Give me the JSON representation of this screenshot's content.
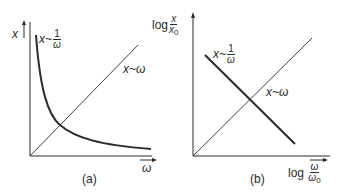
{
  "figure": {
    "panel_a": {
      "caption": "(a)",
      "y_axis_label": "x",
      "x_axis_label": "ω",
      "curves": [
        {
          "name": "inverse",
          "label_left": "x~",
          "label_num": "1",
          "label_den": "ω",
          "shape": "hyperbola",
          "style": "thick"
        },
        {
          "name": "linear",
          "label": "x~ω",
          "shape": "straight line through origin",
          "style": "thin"
        }
      ]
    },
    "panel_b": {
      "caption": "(b)",
      "y_axis_label_prefix": "log",
      "y_axis_num": "x",
      "y_axis_den": "x",
      "y_axis_den_sub": "0",
      "x_axis_label_prefix": "log",
      "x_axis_num": "ω",
      "x_axis_den": "ω",
      "x_axis_den_sub": "0",
      "curves": [
        {
          "name": "inverse",
          "label_left": "x~",
          "label_num": "1",
          "label_den": "ω",
          "shape": "straight line, negative slope",
          "style": "thick"
        },
        {
          "name": "linear",
          "label": "x~ω",
          "shape": "straight line, positive slope",
          "style": "thin"
        }
      ]
    },
    "colors": {
      "ink": "#2a2a2a",
      "background": "#ffffff"
    }
  }
}
